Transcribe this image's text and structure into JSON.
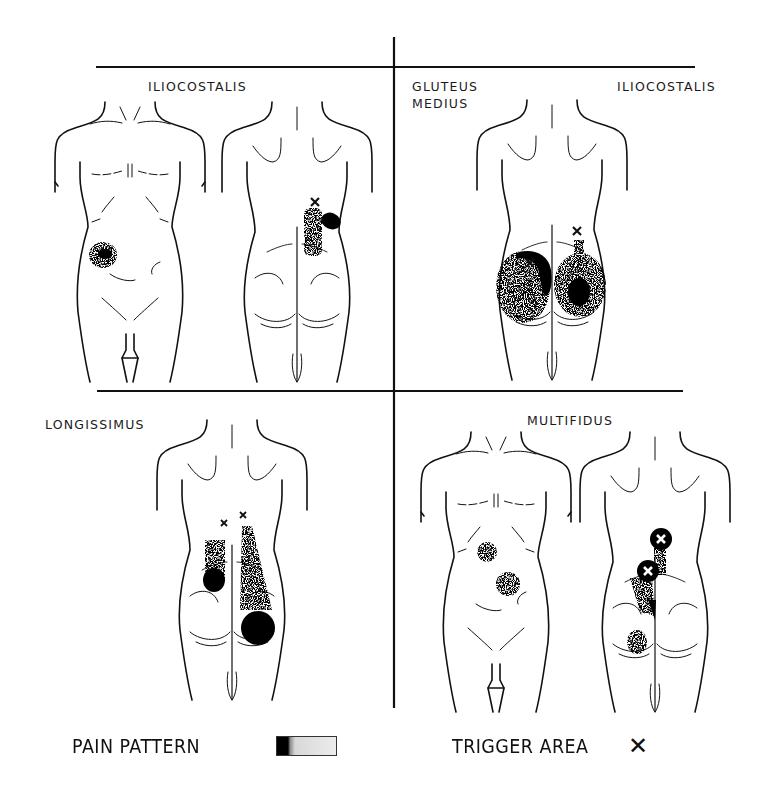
{
  "figure": {
    "panels": [
      {
        "id": "top-left",
        "labels": [
          "ILIOCOSTALIS"
        ],
        "views": [
          "front",
          "back"
        ],
        "trigger_points": 1
      },
      {
        "id": "top-right",
        "labels": [
          "GLUTEUS\nMEDIUS",
          "ILIOCOSTALIS"
        ],
        "views": [
          "back"
        ],
        "trigger_points": 2
      },
      {
        "id": "bottom-left",
        "labels": [
          "LONGISSIMUS"
        ],
        "views": [
          "back"
        ],
        "trigger_points": 2
      },
      {
        "id": "bottom-right",
        "labels": [
          "MULTIFIDUS"
        ],
        "views": [
          "front",
          "back"
        ],
        "trigger_points": 2
      }
    ],
    "legend": {
      "pain_pattern_label": "PAIN PATTERN",
      "trigger_area_label": "TRIGGER AREA",
      "trigger_symbol": "✕"
    }
  },
  "colors": {
    "ink": "#111111",
    "paper": "#ffffff"
  }
}
